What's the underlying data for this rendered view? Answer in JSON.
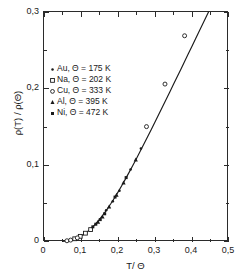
{
  "chart_data": {
    "type": "line",
    "title": "",
    "subtitle": "",
    "xlabel": "T/ Θ",
    "ylabel": "ρ(T) / ρ(Θ)",
    "xlim": [
      0,
      0.5
    ],
    "ylim": [
      0,
      0.3
    ],
    "grid": false,
    "legend_position": "upper-left-inside",
    "xticks": [
      {
        "value": 0,
        "label": "0"
      },
      {
        "value": 0.1,
        "label": "0,1"
      },
      {
        "value": 0.2,
        "label": "0,2"
      },
      {
        "value": 0.3,
        "label": "0,3"
      },
      {
        "value": 0.4,
        "label": "0,4"
      },
      {
        "value": 0.5,
        "label": "0,5"
      }
    ],
    "xticks_minor": [
      0.05,
      0.15,
      0.25,
      0.35,
      0.45
    ],
    "yticks": [
      {
        "value": 0,
        "label": "0"
      },
      {
        "value": 0.1,
        "label": "0,1"
      },
      {
        "value": 0.2,
        "label": "0,2"
      },
      {
        "value": 0.3,
        "label": "0,3"
      }
    ],
    "yticks_minor": [
      0.05,
      0.15,
      0.25
    ],
    "series": [
      {
        "name": "Bloch-Grüneisen curve",
        "kind": "line",
        "marker": "none",
        "color": "#1a1a1a",
        "x": [
          0.05,
          0.06,
          0.07,
          0.08,
          0.09,
          0.1,
          0.11,
          0.12,
          0.13,
          0.14,
          0.15,
          0.16,
          0.17,
          0.18,
          0.19,
          0.2,
          0.21,
          0.22,
          0.23,
          0.24,
          0.25,
          0.26,
          0.27,
          0.28,
          0.29,
          0.3,
          0.31,
          0.32,
          0.33,
          0.34,
          0.35,
          0.36,
          0.37,
          0.38,
          0.39,
          0.4,
          0.41
        ],
        "y": [
          0.0008,
          0.0014,
          0.0023,
          0.0036,
          0.0054,
          0.0078,
          0.0108,
          0.0145,
          0.0188,
          0.0238,
          0.0294,
          0.0356,
          0.0423,
          0.0495,
          0.0571,
          0.0651,
          0.0734,
          0.082,
          0.0908,
          0.0998,
          0.109,
          0.1183,
          0.1277,
          0.1372,
          0.1468,
          0.1565,
          0.1662,
          0.176,
          0.1858,
          0.1957,
          0.2056,
          0.2155,
          0.2254,
          0.2354,
          0.2454,
          0.2554,
          0.2654
        ]
      },
      {
        "name": "Au",
        "label": "Au, Θ = 175 K",
        "kind": "scatter",
        "marker": "small-filled-circle",
        "color": "#1a1a1a",
        "x": [
          0.168,
          0.186,
          0.204,
          0.234,
          0.262
        ],
        "y": [
          0.0415,
          0.053,
          0.0668,
          0.0945,
          0.122
        ]
      },
      {
        "name": "Na",
        "label": "Na, Θ = 202 K",
        "kind": "scatter",
        "marker": "open-square",
        "color": "#1a1a1a",
        "x": [
          0.083,
          0.098,
          0.112,
          0.126
        ],
        "y": [
          0.0042,
          0.0074,
          0.0115,
          0.0162
        ]
      },
      {
        "name": "Cu",
        "label": "Cu, Θ = 333 K",
        "kind": "scatter",
        "marker": "open-circle",
        "color": "#1a1a1a",
        "x": [
          0.062,
          0.072,
          0.09,
          0.277,
          0.327,
          0.38
        ],
        "y": [
          0.0016,
          0.0025,
          0.0054,
          0.1505,
          0.206,
          0.269
        ]
      },
      {
        "name": "Al",
        "label": "Al, Θ = 395 K",
        "kind": "scatter",
        "marker": "filled-triangle",
        "color": "#1a1a1a",
        "x": [
          0.146,
          0.158,
          0.176,
          0.196,
          0.215,
          0.248
        ],
        "y": [
          0.0262,
          0.033,
          0.046,
          0.0613,
          0.0775,
          0.1075
        ]
      },
      {
        "name": "Ni",
        "label": "Ni, Θ = 472 K",
        "kind": "scatter",
        "marker": "filled-square",
        "color": "#1a1a1a",
        "x": [
          0.132,
          0.14,
          0.152,
          0.164,
          0.192,
          0.222
        ],
        "y": [
          0.0198,
          0.0232,
          0.0292,
          0.0368,
          0.0586,
          0.084
        ]
      }
    ],
    "legend": [
      {
        "label": "Au, Θ = 175 K",
        "marker": "small-filled-circle"
      },
      {
        "label": "Na, Θ = 202 K",
        "marker": "open-square"
      },
      {
        "label": "Cu, Θ = 333 K",
        "marker": "open-circle"
      },
      {
        "label": "Al, Θ = 395 K",
        "marker": "filled-triangle"
      },
      {
        "label": "Ni, Θ = 472 K",
        "marker": "filled-square"
      }
    ]
  },
  "axes": {
    "ylabel": "ρ(T) / ρ(Θ)",
    "xlabel": "T/ Θ",
    "ytick_labels": [
      "0,3",
      "0,2",
      "0,1",
      "0"
    ],
    "xtick_labels": [
      "0",
      "0,1",
      "0,2",
      "0,3",
      "0,4",
      "0,5"
    ]
  },
  "legend": {
    "rows": [
      {
        "label": "Au, Θ = 175 K"
      },
      {
        "label": "Na, Θ = 202 K"
      },
      {
        "label": "Cu, Θ = 333 K"
      },
      {
        "label": "Al, Θ = 395 K"
      },
      {
        "label": "Ni, Θ = 472 K"
      }
    ]
  },
  "colors": {
    "ink": "#1a1a1a",
    "frame": "#2b2b2b",
    "background": "#ffffff"
  }
}
